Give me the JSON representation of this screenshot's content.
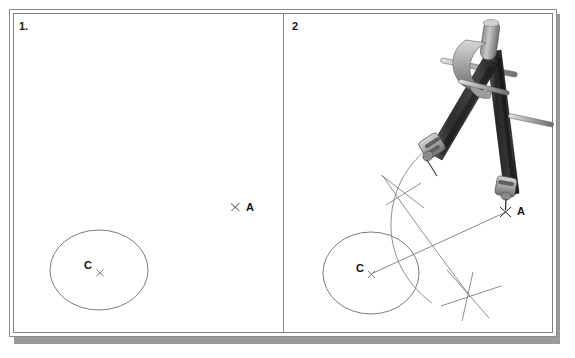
{
  "figure": {
    "type": "two-panel geometry construction diagram",
    "background_color": "#ffffff",
    "frame_color": "#8d8d8d",
    "shadow_color": "#9a9a9a"
  },
  "panels": [
    {
      "number_label": "1.",
      "description": "Given figure: a circle with centre C and a separate point A marked outside the circle.",
      "elements": {
        "circle": {
          "center_label": "C",
          "cx": 99,
          "cy": 270,
          "rx": 49,
          "ry": 40
        },
        "center_mark": {
          "glyph": "x"
        },
        "point_A": {
          "label": "A",
          "x": 235,
          "y": 207,
          "glyph": "x"
        }
      }
    },
    {
      "number_label": "2",
      "description": "A pair of compasses set with the point on A and the pencil sweeping arcs that cross the line CA above and below, constructing the perpendicular bisector.",
      "elements": {
        "circle": {
          "center_label": "C",
          "cx": 371,
          "cy": 273,
          "rx": 48,
          "ry": 41
        },
        "center_mark": {
          "glyph": "x"
        },
        "point_A": {
          "label": "A",
          "x": 505,
          "y": 212,
          "glyph": "x"
        },
        "construction_line": {
          "from": "C",
          "to": "A"
        },
        "arc_intersections": [
          {
            "name": "upper-arc-crossing",
            "x": 403,
            "y": 190
          },
          {
            "name": "lower-arc-crossing",
            "x": 470,
            "y": 296
          }
        ],
        "tool": {
          "name": "compass",
          "body_color": "#3d3d3d",
          "highlight_color": "#b9b9b9",
          "point_leg_tip": "A",
          "pencil_leg_tip": "arc"
        }
      }
    }
  ]
}
